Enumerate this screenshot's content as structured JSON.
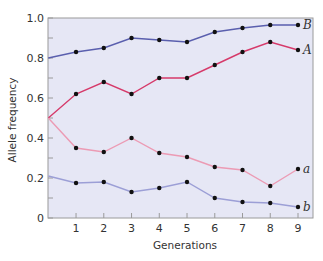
{
  "chart_data": {
    "type": "line",
    "title": "",
    "xlabel": "Generations",
    "ylabel": "Allele frequency",
    "x": [
      0,
      1,
      2,
      3,
      4,
      5,
      6,
      7,
      8,
      9
    ],
    "x_tick_labels": [
      "1",
      "2",
      "3",
      "4",
      "5",
      "6",
      "7",
      "8",
      "9"
    ],
    "y_tick_labels": [
      "0",
      "0.2",
      "0.4",
      "0.6",
      "0.8",
      "1.0"
    ],
    "y_ticks": [
      0,
      0.2,
      0.4,
      0.6,
      0.8,
      1.0
    ],
    "xlim": [
      0,
      9
    ],
    "ylim": [
      0,
      1.0
    ],
    "grid": false,
    "legend": "inline labels at right end of each line",
    "background_color": "#e6e7f5",
    "series": [
      {
        "name": "B",
        "color": "#5a5fae",
        "values": [
          0.8,
          0.83,
          0.85,
          0.9,
          0.89,
          0.88,
          0.93,
          0.95,
          0.965,
          0.965
        ]
      },
      {
        "name": "A",
        "color": "#d63a6a",
        "values": [
          0.5,
          0.62,
          0.68,
          0.62,
          0.7,
          0.7,
          0.765,
          0.83,
          0.88,
          0.84
        ]
      },
      {
        "name": "a",
        "color": "#ec9bb4",
        "values": [
          0.5,
          0.35,
          0.33,
          0.4,
          0.325,
          0.305,
          0.255,
          0.24,
          0.16,
          0.245
        ]
      },
      {
        "name": "b",
        "color": "#9c9fd6",
        "values": [
          0.21,
          0.175,
          0.18,
          0.13,
          0.15,
          0.18,
          0.1,
          0.08,
          0.075,
          0.055
        ]
      }
    ]
  }
}
